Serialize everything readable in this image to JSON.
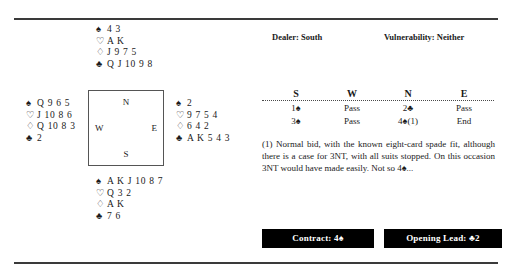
{
  "board": {
    "dealer_label": "Dealer: South",
    "vulnerability_label": "Vulnerability: Neither"
  },
  "compass": {
    "north": "N",
    "south": "S",
    "west": "W",
    "east": "E"
  },
  "suits": {
    "spade": "♠",
    "heart": "♡",
    "diamond": "♢",
    "club": "♣"
  },
  "hands": {
    "north": {
      "label": "North",
      "spades": "4 3",
      "hearts": "A K",
      "diamonds": "J 9 7 5",
      "clubs": "Q J 10 9 8"
    },
    "west": {
      "label": "West",
      "spades": "Q 9 6 5",
      "hearts": "J 10 8 6",
      "diamonds": "Q 10 8 3",
      "clubs": "2"
    },
    "east": {
      "label": "East",
      "spades": "2",
      "hearts": "9 7 5 4",
      "diamonds": "6 4 2",
      "clubs": "A K 5 4 3"
    },
    "south": {
      "label": "South",
      "spades": "A K J 10 8 7",
      "hearts": "Q 3 2",
      "diamonds": "A K",
      "clubs": "7 6"
    }
  },
  "auction": {
    "headers": [
      "S",
      "W",
      "N",
      "E"
    ],
    "rows": [
      [
        "1♠",
        "Pass",
        "2♣",
        "Pass"
      ],
      [
        "3♠",
        "Pass",
        "4♠(1)",
        "End"
      ]
    ]
  },
  "commentary": {
    "text": "(1) Normal bid, with the known eight-card spade fit, although there is a case for 3NT, with all suits stopped. On this occasion 3NT would have made easily. Not so 4♠..."
  },
  "result": {
    "contract_label": "Contract:",
    "contract_value": "4♠",
    "lead_label": "Opening Lead:",
    "lead_value": "♣2"
  }
}
